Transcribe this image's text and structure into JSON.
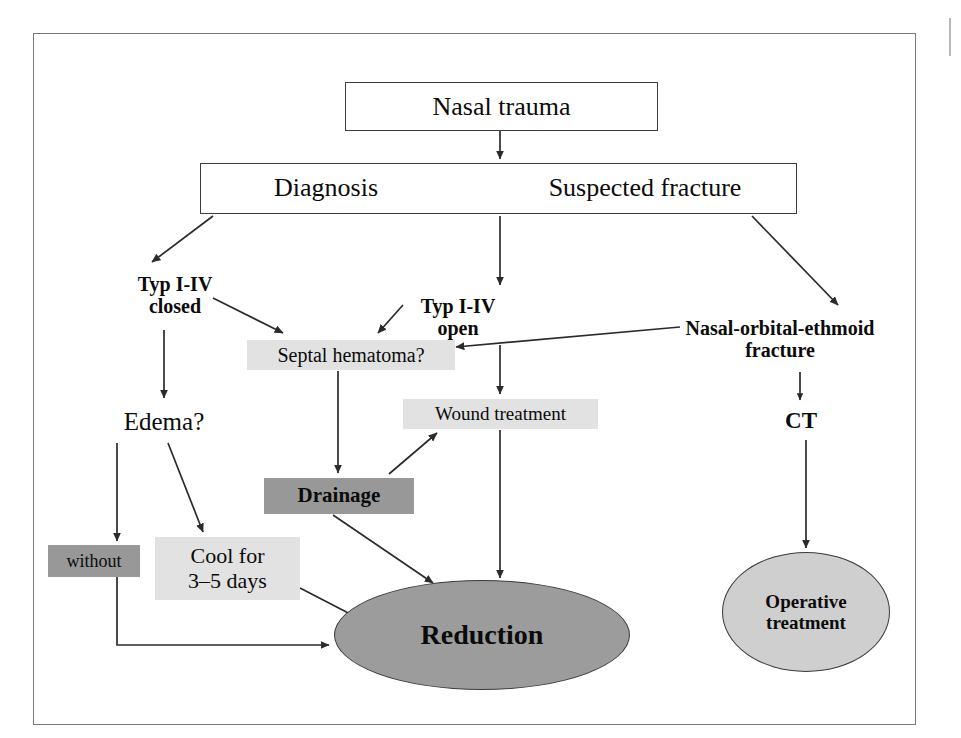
{
  "diagram": {
    "frame": {
      "visible": true
    },
    "colors": {
      "shade_light": "#e2e2e2",
      "shade_dark": "#989898",
      "ellipse_dark": "#9c9c9c",
      "ellipse_light": "#cfcfcf",
      "line": "#2b2b2b",
      "text": "#0b0b0b"
    },
    "nodes": {
      "nasal_trauma": "Nasal trauma",
      "diagnosis": "Diagnosis",
      "suspected_fracture": "Suspected fracture",
      "typ_closed": "Typ I-IV\nclosed",
      "typ_open": "Typ I-IV\nopen",
      "noe_fracture": "Nasal-orbital-ethmoid\nfracture",
      "septal_hematoma": "Septal hematoma?",
      "edema": "Edema?",
      "wound_treatment": "Wound treatment",
      "ct": "CT",
      "drainage": "Drainage",
      "without": "without",
      "cool": "Cool for\n3–5 days",
      "reduction": "Reduction",
      "operative_treatment": "Operative\ntreatment"
    },
    "edges": [
      {
        "from": "nasal_trauma",
        "to": "diagnosis_bar",
        "style": "straight-arrow"
      },
      {
        "from": "diagnosis_bar",
        "to": "typ_closed",
        "style": "diagonal-arrow"
      },
      {
        "from": "diagnosis_bar",
        "to": "typ_open",
        "style": "straight-arrow"
      },
      {
        "from": "diagnosis_bar",
        "to": "noe_fracture",
        "style": "diagonal-arrow"
      },
      {
        "from": "typ_closed",
        "to": "septal_hematoma",
        "style": "diagonal-arrow"
      },
      {
        "from": "typ_closed",
        "to": "edema",
        "style": "straight-arrow"
      },
      {
        "from": "typ_open",
        "to": "septal_hematoma",
        "style": "diagonal-arrow"
      },
      {
        "from": "typ_open",
        "to": "wound_treatment",
        "style": "straight-arrow"
      },
      {
        "from": "noe_fracture",
        "to": "septal_hematoma",
        "style": "long-left-arrow"
      },
      {
        "from": "noe_fracture",
        "to": "ct",
        "style": "straight-arrow"
      },
      {
        "from": "septal_hematoma",
        "to": "drainage",
        "style": "straight-arrow"
      },
      {
        "from": "edema",
        "to": "without",
        "style": "straight-arrow"
      },
      {
        "from": "edema",
        "to": "cool",
        "style": "diagonal-arrow"
      },
      {
        "from": "drainage",
        "to": "wound_treatment",
        "style": "diagonal-arrow"
      },
      {
        "from": "drainage",
        "to": "reduction",
        "style": "diagonal-arrow"
      },
      {
        "from": "wound_treatment",
        "to": "reduction",
        "style": "straight-arrow"
      },
      {
        "from": "cool",
        "to": "reduction",
        "style": "diagonal-arrow"
      },
      {
        "from": "without",
        "to": "reduction",
        "style": "elbow-arrow"
      },
      {
        "from": "ct",
        "to": "operative_treatment",
        "style": "straight-arrow"
      }
    ]
  }
}
